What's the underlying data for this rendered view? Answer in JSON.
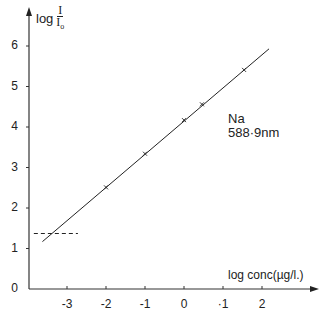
{
  "chart_data": {
    "type": "line",
    "title": "",
    "xlabel": "log conc(µg/l.)",
    "ylabel": "log I/I₀",
    "ylabel_parts": {
      "prefix": "log",
      "numerator": "I",
      "denominator": "I",
      "denominator_sub": "o"
    },
    "xlim": [
      -3.9,
      3.3
    ],
    "ylim": [
      0,
      6.9
    ],
    "x_ticks": [
      -3,
      -2,
      -1,
      0,
      1,
      2
    ],
    "x_tick_labels": [
      "-3",
      "-2",
      "-1",
      "0",
      "·1",
      "2"
    ],
    "y_ticks": [
      0,
      1,
      2,
      3,
      4,
      5,
      6
    ],
    "y_tick_labels": [
      "0",
      "1",
      "2",
      "3",
      "4",
      "5",
      "6"
    ],
    "grid": false,
    "legend": null,
    "series": [
      {
        "name": "Na 588·9nm",
        "kind": "fit-line",
        "x": [
          -3.63,
          2.18
        ],
        "y": [
          1.17,
          5.93
        ]
      },
      {
        "name": "measured points",
        "kind": "markers",
        "marker": "x",
        "x": [
          -2.0,
          -1.0,
          0.0,
          0.46,
          1.54
        ],
        "y": [
          2.51,
          3.34,
          4.17,
          4.56,
          5.41
        ]
      },
      {
        "name": "detection limit",
        "kind": "dashed-line",
        "x": [
          -3.85,
          -2.72
        ],
        "y": [
          1.37,
          1.37
        ]
      }
    ],
    "annotations": [
      {
        "text": "Na",
        "x": 1.1,
        "y": 4.2
      },
      {
        "text": "588·9nm",
        "x": 1.1,
        "y": 3.9
      }
    ]
  },
  "labels": {
    "y_prefix": "log",
    "y_num": "I",
    "y_den": "I",
    "y_den_sub": "o",
    "x_axis": "log conc(µg/l.)",
    "anno_line1": "Na",
    "anno_line2": "588·9nm"
  }
}
